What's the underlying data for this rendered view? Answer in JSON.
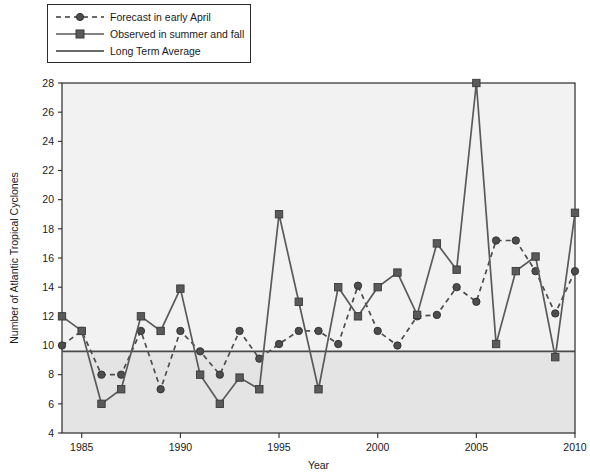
{
  "chart_data": {
    "type": "line",
    "title": "",
    "xlabel": "Year",
    "ylabel": "Number of Atlantic Tropical Cyclones",
    "xlim": [
      1984,
      2010
    ],
    "ylim": [
      4,
      28
    ],
    "ytick_step": 2,
    "yticks": [
      4,
      6,
      8,
      10,
      12,
      14,
      16,
      18,
      20,
      22,
      24,
      26,
      28
    ],
    "xticks": [
      1985,
      1990,
      1995,
      2000,
      2005,
      2010
    ],
    "xtick_labels": [
      "1985",
      "1990",
      "1995",
      "2000",
      "2005",
      "2010"
    ],
    "ytick_labels": [
      "4",
      "6",
      "8",
      "10",
      "12",
      "14",
      "16",
      "18",
      "20",
      "22",
      "24",
      "26",
      "28"
    ],
    "grid": false,
    "legend_position": "top-left",
    "x": [
      1984,
      1985,
      1986,
      1987,
      1988,
      1989,
      1990,
      1991,
      1992,
      1993,
      1994,
      1995,
      1996,
      1997,
      1998,
      1999,
      2000,
      2001,
      2002,
      2003,
      2004,
      2005,
      2006,
      2007,
      2008,
      2009,
      2010
    ],
    "series": [
      {
        "name": "Forecast in early April",
        "style": "dashed",
        "marker": "circle",
        "color": "#4d4d4d",
        "values": [
          10.0,
          11.0,
          8.0,
          8.0,
          11.0,
          7.0,
          11.0,
          9.6,
          8.0,
          11.0,
          9.1,
          10.1,
          11.0,
          11.0,
          10.1,
          14.1,
          11.0,
          10.0,
          12.0,
          12.1,
          14.0,
          13.0,
          17.2,
          17.2,
          15.1,
          12.2,
          15.1
        ]
      },
      {
        "name": "Observed in summer and fall",
        "style": "solid",
        "marker": "square",
        "color": "#5a5a5a",
        "values": [
          12.0,
          11.0,
          6.0,
          7.0,
          12.0,
          11.0,
          13.9,
          8.0,
          6.0,
          7.8,
          7.0,
          19.0,
          13.0,
          7.0,
          14.0,
          12.0,
          14.0,
          15.0,
          12.1,
          17.0,
          15.2,
          28.0,
          10.1,
          15.1,
          16.1,
          9.2,
          19.1
        ]
      }
    ],
    "reference_line": {
      "name": "Long Term Average",
      "value": 9.6,
      "color": "#4a4a4a"
    }
  },
  "legend": {
    "items": [
      {
        "label": "Forecast in early April",
        "sample": "dashed-circle"
      },
      {
        "label": "Observed in summer and fall",
        "sample": "solid-square"
      },
      {
        "label": "Long Term Average",
        "sample": "solid-line"
      }
    ]
  },
  "axes": {
    "x_title": "Year",
    "y_title": "Number of Atlantic Tropical Cyclones"
  }
}
